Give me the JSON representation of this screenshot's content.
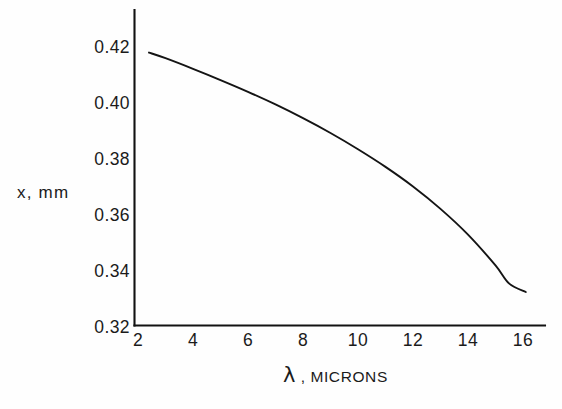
{
  "figure": {
    "background_color": "#fefefe",
    "ink_color": "#141414"
  },
  "axes": {
    "y_label": "x, mm",
    "x_label_symbol": "λ",
    "x_label_separator": ",",
    "x_label_units": "MICRONS",
    "y_ticks": [
      "0.42",
      "0.40",
      "0.38",
      "0.36",
      "0.34",
      "0.32"
    ],
    "x_ticks": [
      "2",
      "4",
      "6",
      "8",
      "10",
      "12",
      "14",
      "16"
    ]
  },
  "chart_data": {
    "type": "line",
    "title": "",
    "xlabel": "λ, MICRONS",
    "ylabel": "x, mm",
    "xlim": [
      2,
      17
    ],
    "ylim": [
      0.32,
      0.43
    ],
    "xticks": [
      2,
      4,
      6,
      8,
      10,
      12,
      14,
      16
    ],
    "yticks": [
      0.32,
      0.34,
      0.36,
      0.38,
      0.4,
      0.42
    ],
    "grid": false,
    "legend": false,
    "series": [
      {
        "name": "x vs lambda",
        "x": [
          2.4,
          3.0,
          4.0,
          5.0,
          6.0,
          7.0,
          8.0,
          9.0,
          10.0,
          11.0,
          12.0,
          13.0,
          14.0,
          15.0,
          15.5,
          16.1
        ],
        "y": [
          0.418,
          0.416,
          0.4122,
          0.4082,
          0.404,
          0.3995,
          0.3946,
          0.3893,
          0.3835,
          0.3772,
          0.3702,
          0.3622,
          0.353,
          0.342,
          0.3355,
          0.3325
        ]
      }
    ]
  }
}
